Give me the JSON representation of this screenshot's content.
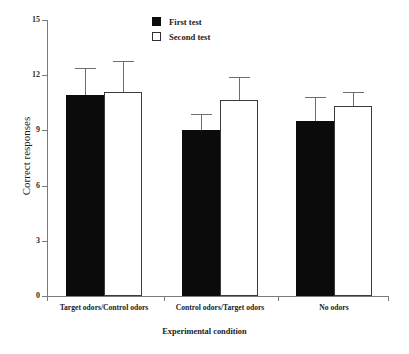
{
  "chart_data": {
    "type": "bar",
    "title": "",
    "xlabel": "Experimental condition",
    "ylabel": "Correct responses",
    "categories": [
      "Target odors/Control odors",
      "Control odors/Target odors",
      "No odors"
    ],
    "series": [
      {
        "name": "First test",
        "color": "#000000",
        "values": [
          10.9,
          9.0,
          9.5
        ],
        "errors": [
          1.5,
          0.9,
          1.3
        ]
      },
      {
        "name": "Second test",
        "color": "#ffffff",
        "values": [
          11.1,
          10.65,
          10.3
        ],
        "errors": [
          1.65,
          1.25,
          0.8
        ]
      }
    ],
    "ylim": [
      0,
      15
    ],
    "yticks": [
      0,
      3,
      6,
      9,
      12,
      15
    ],
    "ytick_labels": [
      "0",
      "3",
      "6",
      "9",
      "12",
      "15"
    ],
    "grid": false,
    "legend_position": "top-center",
    "error_bar_style": "upper-only-cap"
  },
  "legend": {
    "items": [
      {
        "label": "First test",
        "swatch": "filled-black-square"
      },
      {
        "label": "Second test",
        "swatch": "open-white-square"
      }
    ]
  },
  "axes": {
    "y_title": "Correct responses",
    "x_title": "Experimental condition",
    "y_tick_labels": [
      "15",
      "12",
      "9",
      "6",
      "3",
      "0"
    ],
    "x_category_labels": [
      "Target odors/Control odors",
      "Control odors/Target odors",
      "No odors"
    ]
  }
}
